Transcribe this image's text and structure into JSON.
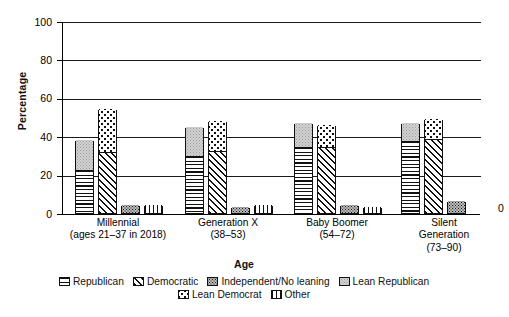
{
  "top_artifact": "",
  "axis": {
    "ylabel": "Percentage",
    "xlabel": "Age",
    "yticks": [
      "0",
      "20",
      "40",
      "60",
      "80",
      "100"
    ]
  },
  "zero_annotation": "0",
  "legend": {
    "row1": [
      {
        "label": "Republican",
        "pattern": "horizontal-lines",
        "icon": "swatch-republican"
      },
      {
        "label": "Democratic",
        "pattern": "diagonal-hatch",
        "icon": "swatch-democratic"
      },
      {
        "label": "Independent/No leaning",
        "pattern": "dark-stipple",
        "icon": "swatch-independent"
      },
      {
        "label": "Lean Republican",
        "pattern": "light-gray-fine-stipple",
        "icon": "swatch-lean-republican"
      }
    ],
    "row2": [
      {
        "label": "Lean Democrat",
        "pattern": "coarse-dots",
        "icon": "swatch-lean-democrat"
      },
      {
        "label": "Other",
        "pattern": "vertical-lines",
        "icon": "swatch-other"
      }
    ]
  },
  "groups": [
    {
      "line1": "Millennial",
      "line2": "(ages 21–37 in 2018)",
      "line3": ""
    },
    {
      "line1": "Generation X",
      "line2": "(38–53)",
      "line3": ""
    },
    {
      "line1": "Baby Boomer",
      "line2": "(54–72)",
      "line3": ""
    },
    {
      "line1": "Silent",
      "line2": "Generation",
      "line3": "(73–90)"
    }
  ],
  "chart_data": {
    "type": "bar",
    "title": "",
    "xlabel": "Age",
    "ylabel": "Percentage",
    "ylim": [
      0,
      100
    ],
    "ytick_step": 20,
    "grid": "horizontal",
    "legend_position": "bottom",
    "categories": [
      "Millennial (ages 21-37 in 2018)",
      "Generation X (38-53)",
      "Baby Boomer (54-72)",
      "Silent Generation (73-90)"
    ],
    "series": [
      {
        "name": "Republican",
        "values": [
          22,
          29,
          34,
          37
        ]
      },
      {
        "name": "Lean Republican",
        "values": [
          16,
          16,
          13,
          10
        ],
        "stacked_on": "Republican",
        "cumulative_tops": [
          38,
          45,
          47,
          47
        ]
      },
      {
        "name": "Democratic",
        "values": [
          31,
          32,
          34,
          38
        ]
      },
      {
        "name": "Lean Democrat",
        "values": [
          23,
          16,
          12,
          11
        ],
        "stacked_on": "Democratic",
        "cumulative_tops": [
          54,
          48,
          46,
          49
        ]
      },
      {
        "name": "Independent/No leaning",
        "values": [
          4,
          3,
          4,
          6
        ]
      },
      {
        "name": "Other",
        "values": [
          4,
          4,
          3,
          0
        ]
      }
    ]
  }
}
